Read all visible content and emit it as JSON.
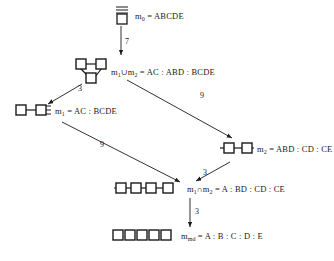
{
  "diagram": {
    "background_color": "#ffffff",
    "stroke_color": "#1a1a1a",
    "box_fill": "#ffffff"
  },
  "nodes": [
    {
      "id": "m0",
      "name": "node-m0",
      "icon": "complete-graph-icon",
      "label_name": "m",
      "label_sub": "0",
      "label_eq": " = ",
      "label_value": "ABCDE",
      "label_full": "m0 = ABCDE"
    },
    {
      "id": "union",
      "name": "node-union",
      "icon": "triangle-graph-icon",
      "label_name": "m",
      "label_sub": "1",
      "label_op": "∪",
      "label_name2": "m",
      "label_sub2": "2",
      "label_eq": " = ",
      "label_value": "AC : ABD : BCDE",
      "label_full": "m1 ∪ m2 = AC : ABD : BCDE"
    },
    {
      "id": "m1",
      "name": "node-m1",
      "icon": "two-box-chain-icon",
      "label_name": "m",
      "label_sub": "1",
      "label_eq": " = ",
      "label_value": "AC : BCDE",
      "label_full": "m1 = AC : BCDE"
    },
    {
      "id": "m2",
      "name": "node-m2",
      "icon": "three-box-chain-icon",
      "label_name": "m",
      "label_sub": "2",
      "label_eq": " = ",
      "label_value": "ABD : CD : CE",
      "label_full": "m2 = ABD : CD : CE"
    },
    {
      "id": "intersection",
      "name": "node-intersection",
      "icon": "four-box-chain-icon",
      "label_name": "m",
      "label_sub": "1",
      "label_op": "∩",
      "label_name2": "m",
      "label_sub2": "2",
      "label_eq": " = ",
      "label_value": "A : BD : CD : CE",
      "label_full": "m1 ∩ m2 = A : BD : CD : CE"
    },
    {
      "id": "mmd",
      "name": "node-mmd",
      "icon": "five-separate-boxes-icon",
      "label_name": "m",
      "label_sub": "md",
      "label_eq": " = ",
      "label_value": "A : B : C : D : E",
      "label_full": "mmd = A : B : C : D : E"
    }
  ],
  "edges": [
    {
      "id": "e1",
      "from": "m0",
      "to": "union",
      "label": "7"
    },
    {
      "id": "e2",
      "from": "union",
      "to": "m1",
      "label": "3"
    },
    {
      "id": "e3",
      "from": "union",
      "to": "m2",
      "label": "9"
    },
    {
      "id": "e4",
      "from": "m1",
      "to": "intersection",
      "label": "9"
    },
    {
      "id": "e5",
      "from": "m2",
      "to": "intersection",
      "label": "3"
    },
    {
      "id": "e6",
      "from": "intersection",
      "to": "mmd",
      "label": "3"
    }
  ]
}
